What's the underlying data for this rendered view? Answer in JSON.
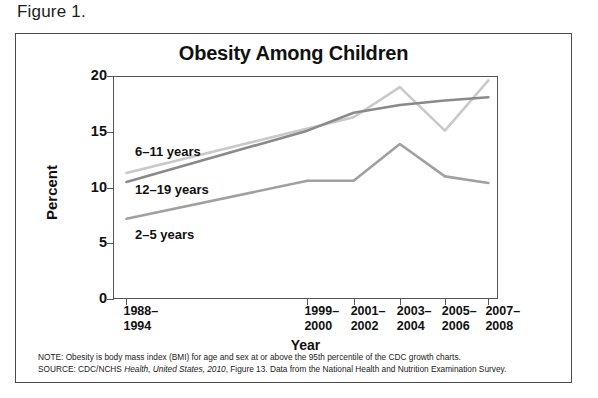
{
  "figure": {
    "caption": "Figure 1."
  },
  "chart_data": {
    "type": "line",
    "title": "Obesity Among Children",
    "xlabel": "Year",
    "ylabel": "Percent",
    "ylim": [
      0,
      20
    ],
    "yticks": [
      0,
      5,
      10,
      15,
      20
    ],
    "ytick_labels": [
      "0",
      "5",
      "10",
      "15",
      "20"
    ],
    "grid": false,
    "legend_position": "inline-labels",
    "categories": [
      "1988–\n1994",
      "1999–\n2000",
      "2001–\n2002",
      "2003–\n2004",
      "2005–\n2006",
      "2007–\n2008"
    ],
    "category_labels_flat": [
      "1988–1994",
      "1999–2000",
      "2001–2002",
      "2003–2004",
      "2005–2006",
      "2007–2008"
    ],
    "series": [
      {
        "name": "6–11 years",
        "color": "#c9c9c9",
        "values": [
          11.3,
          15.3,
          16.3,
          19.0,
          15.1,
          19.6
        ]
      },
      {
        "name": "12–19 years",
        "color": "#8a8a8a",
        "values": [
          10.5,
          15.1,
          16.7,
          17.4,
          17.8,
          18.1
        ]
      },
      {
        "name": "2–5 years",
        "color": "#a0a0a0",
        "values": [
          7.2,
          10.6,
          10.6,
          13.9,
          11.0,
          10.4
        ]
      }
    ]
  },
  "annotations": {
    "label_6_11": "6–11 years",
    "label_12_19": "12–19 years",
    "label_2_5": "2–5 years"
  },
  "footnotes": {
    "note_prefix": "NOTE: Obesity is body mass index (BMI) for age and sex at or above the 95th percentile of the CDC growth charts.",
    "source_part1": "SOURCE: CDC/NCHS ",
    "source_italic": "Health, United States, 2010",
    "source_part2": ", Figure 13. Data from the National Health and Nutrition Examination Survey."
  }
}
